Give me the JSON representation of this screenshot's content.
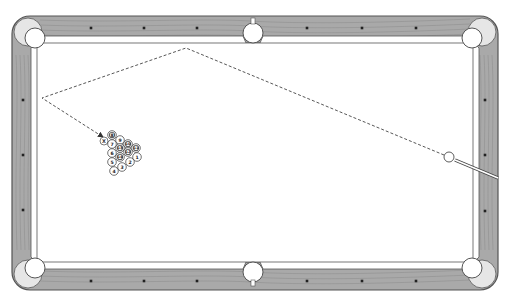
{
  "diagram": {
    "type": "pool-table-shot-diagram",
    "colors": {
      "background": "#ffffff",
      "felt": "#ffffff",
      "rail_wood": "#a9a9a9",
      "rail_grain": "#8a8a8a",
      "outline": "#555555",
      "diamond": "#222222",
      "pocket_fill": "#ffffff",
      "ball_stripe": "#555555",
      "cue": "#ffffff"
    },
    "table": {
      "outer": {
        "x": 12,
        "y": 16,
        "w": 486,
        "h": 274,
        "r": 18
      },
      "inner": {
        "x": 31,
        "y": 43,
        "w": 448,
        "h": 219
      },
      "rail_diamonds": [
        {
          "x": 91,
          "y": 28
        },
        {
          "x": 144,
          "y": 28
        },
        {
          "x": 197,
          "y": 28
        },
        {
          "x": 307,
          "y": 28
        },
        {
          "x": 362,
          "y": 28
        },
        {
          "x": 416,
          "y": 28
        },
        {
          "x": 91,
          "y": 281
        },
        {
          "x": 144,
          "y": 281
        },
        {
          "x": 197,
          "y": 281
        },
        {
          "x": 307,
          "y": 281
        },
        {
          "x": 362,
          "y": 281
        },
        {
          "x": 416,
          "y": 281
        },
        {
          "x": 23,
          "y": 100
        },
        {
          "x": 23,
          "y": 155
        },
        {
          "x": 23,
          "y": 210
        },
        {
          "x": 485,
          "y": 100
        },
        {
          "x": 485,
          "y": 155
        },
        {
          "x": 485,
          "y": 211
        }
      ],
      "pockets": [
        {
          "name": "top-left",
          "x": 35,
          "y": 38,
          "r": 10
        },
        {
          "name": "top-center",
          "x": 253,
          "y": 33,
          "r": 10
        },
        {
          "name": "top-right",
          "x": 472,
          "y": 38,
          "r": 10
        },
        {
          "name": "bottom-left",
          "x": 35,
          "y": 268,
          "r": 10
        },
        {
          "name": "bottom-center",
          "x": 253,
          "y": 272,
          "r": 10
        },
        {
          "name": "bottom-right",
          "x": 472,
          "y": 268,
          "r": 10
        }
      ]
    },
    "cue_ball": {
      "x": 449,
      "y": 157,
      "r": 5
    },
    "cue_stick": {
      "x1": 455,
      "y1": 160,
      "x2": 498,
      "y2": 178
    },
    "shot_path": {
      "points": [
        [
          444,
          155
        ],
        [
          186,
          48
        ],
        [
          42,
          98
        ],
        [
          103,
          137
        ]
      ],
      "style": "dashed",
      "arrow_end": true
    },
    "ghost_ball": {
      "x": 104,
      "y": 141,
      "r": 4,
      "label": "X"
    },
    "rack": {
      "balls": [
        {
          "label": "8",
          "x": 112,
          "y": 135,
          "striped": true
        },
        {
          "label": "7",
          "x": 112,
          "y": 144,
          "striped": false
        },
        {
          "label": "9",
          "x": 120,
          "y": 140,
          "striped": false
        },
        {
          "label": "6",
          "x": 112,
          "y": 153,
          "striped": false
        },
        {
          "label": "13",
          "x": 120,
          "y": 148,
          "striped": true
        },
        {
          "label": "10",
          "x": 128,
          "y": 144,
          "striped": true
        },
        {
          "label": "5",
          "x": 112,
          "y": 162,
          "striped": false
        },
        {
          "label": "14",
          "x": 120,
          "y": 157,
          "striped": true
        },
        {
          "label": "12",
          "x": 128,
          "y": 152,
          "striped": true
        },
        {
          "label": "11",
          "x": 136,
          "y": 148,
          "striped": true
        },
        {
          "label": "4",
          "x": 114,
          "y": 171,
          "striped": false
        },
        {
          "label": "3",
          "x": 122,
          "y": 167,
          "striped": false
        },
        {
          "label": "2",
          "x": 130,
          "y": 162,
          "striped": false
        },
        {
          "label": "1",
          "x": 137,
          "y": 157,
          "striped": false
        }
      ],
      "ball_radius": 4.3
    }
  }
}
